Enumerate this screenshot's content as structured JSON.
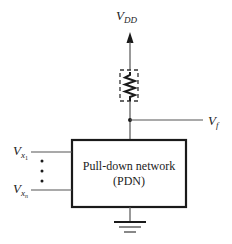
{
  "diagram": {
    "supply_label": "V",
    "supply_subscript": "DD",
    "output_label": "V",
    "output_subscript": "f",
    "input_first_label": "V",
    "input_first_subscript": "x",
    "input_first_sub2": "1",
    "input_last_label": "V",
    "input_last_subscript": "x",
    "input_last_sub2": "n",
    "block_line1": "Pull-down network",
    "block_line2": "(PDN)",
    "colors": {
      "stroke": "#1a1a1a",
      "wire": "#555555",
      "background": "#ffffff"
    }
  }
}
